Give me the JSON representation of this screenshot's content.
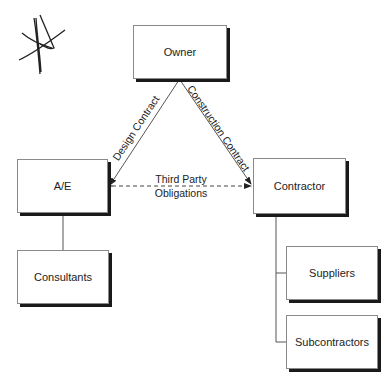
{
  "diagram": {
    "type": "contractual-relationships",
    "nodes": {
      "owner": "Owner",
      "ae": "A/E",
      "contractor": "Contractor",
      "consultants": "Consultants",
      "suppliers": "Suppliers",
      "subcontractors": "Subcontractors"
    },
    "edges": {
      "design_contract": "Design Contract",
      "construction_contract": "Construction Contract",
      "third_party_line1": "Third Party",
      "third_party_line2": "Obligations"
    },
    "colors": {
      "line": "#555555",
      "shadow": "#1a1a1a",
      "text": "#222222"
    }
  }
}
